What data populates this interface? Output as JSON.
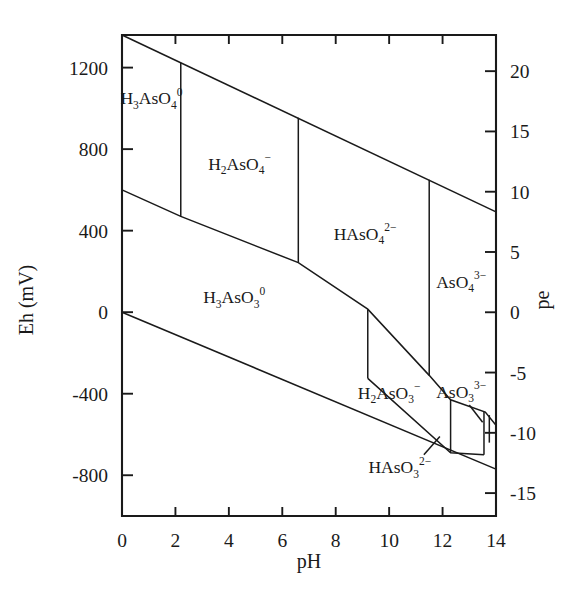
{
  "figure": {
    "kind": "eh-ph-pourbaix-diagram",
    "background_color": "#ffffff",
    "line_color": "#1a1a1a"
  },
  "axes": {
    "x": {
      "title": "pH",
      "min": 0,
      "max": 14,
      "tick_values": [
        0,
        2,
        4,
        6,
        8,
        10,
        12,
        14
      ],
      "tick_labels": [
        "0",
        "2",
        "4",
        "6",
        "8",
        "10",
        "12",
        "14"
      ]
    },
    "y_left": {
      "title": "Eh (mV)",
      "min": -1000,
      "max": 1360,
      "tick_values": [
        1200,
        800,
        400,
        0,
        -400,
        -800
      ],
      "tick_labels": [
        "1200",
        "800",
        "400",
        "0",
        "-400",
        "-800"
      ]
    },
    "y_right": {
      "title": "pe",
      "min": -16.9,
      "max": 23.0,
      "tick_values": [
        20,
        15,
        10,
        5,
        0,
        -5,
        -10,
        -15
      ],
      "tick_labels": [
        "20",
        "15",
        "10",
        "5",
        "0",
        "-5",
        "-10",
        "-15"
      ]
    }
  },
  "chart_data": {
    "type": "line",
    "title": "",
    "xlabel": "pH",
    "ylabel": "Eh (mV)",
    "ylabel_secondary": "pe",
    "xlim": [
      0,
      14
    ],
    "ylim": [
      -1000,
      1360
    ],
    "ylim_secondary": [
      -16.9,
      23.0
    ],
    "grid": false,
    "legend": "none",
    "fields": [
      {
        "name": "H3AsO4-0",
        "label_parts": [
          {
            "t": "H",
            "k": "base"
          },
          {
            "t": "3",
            "k": "sub"
          },
          {
            "t": "AsO",
            "k": "base"
          },
          {
            "t": "4",
            "k": "sub"
          },
          {
            "t": "0",
            "k": "sup"
          }
        ],
        "label_ph": 1.1,
        "label_eh": 1020
      },
      {
        "name": "H2AsO4-minus",
        "label_parts": [
          {
            "t": "H",
            "k": "base"
          },
          {
            "t": "2",
            "k": "sub"
          },
          {
            "t": "AsO",
            "k": "base"
          },
          {
            "t": "4",
            "k": "sub"
          },
          {
            "t": "−",
            "k": "sup"
          }
        ],
        "label_ph": 4.4,
        "label_eh": 700
      },
      {
        "name": "HAsO4-2minus",
        "label_parts": [
          {
            "t": "HAsO",
            "k": "base"
          },
          {
            "t": "4",
            "k": "sub"
          },
          {
            "t": "2−",
            "k": "sup"
          }
        ],
        "label_ph": 9.1,
        "label_eh": 355
      },
      {
        "name": "AsO4-3minus",
        "label_parts": [
          {
            "t": "AsO",
            "k": "base"
          },
          {
            "t": "4",
            "k": "sub"
          },
          {
            "t": "3−",
            "k": "sup"
          }
        ],
        "label_ph": 12.7,
        "label_eh": 120
      },
      {
        "name": "H3AsO3-0",
        "label_parts": [
          {
            "t": "H",
            "k": "base"
          },
          {
            "t": "3",
            "k": "sub"
          },
          {
            "t": "AsO",
            "k": "base"
          },
          {
            "t": "3",
            "k": "sub"
          },
          {
            "t": "0",
            "k": "sup"
          }
        ],
        "label_ph": 4.2,
        "label_eh": 45
      },
      {
        "name": "H2AsO3-minus",
        "label_parts": [
          {
            "t": "H",
            "k": "base"
          },
          {
            "t": "2",
            "k": "sub"
          },
          {
            "t": "AsO",
            "k": "base"
          },
          {
            "t": "3",
            "k": "sub"
          },
          {
            "t": "−",
            "k": "sup"
          }
        ],
        "label_ph": 10.0,
        "label_eh": -425
      },
      {
        "name": "AsO3-3minus",
        "label_parts": [
          {
            "t": "AsO",
            "k": "base"
          },
          {
            "t": "3",
            "k": "sub"
          },
          {
            "t": "3−",
            "k": "sup"
          }
        ],
        "label_ph": 12.7,
        "label_eh": -420
      },
      {
        "name": "HAsO3-2minus",
        "label_parts": [
          {
            "t": "HAsO",
            "k": "base"
          },
          {
            "t": "3",
            "k": "sub"
          },
          {
            "t": "2−",
            "k": "sup"
          }
        ],
        "label_ph": 10.4,
        "label_eh": -790
      }
    ],
    "series": [
      {
        "name": "water-upper-stability-limit",
        "comment": "O2/H2O line across full pH range",
        "points": [
          [
            0,
            1360
          ],
          [
            14,
            492
          ]
        ]
      },
      {
        "name": "water-lower-stability-limit",
        "comment": "H2O/H2 line across full pH range",
        "points": [
          [
            0,
            0
          ],
          [
            14,
            -770
          ]
        ]
      },
      {
        "name": "As(V)/As(III)-redox-boundary",
        "comment": "stepped boundary between arsenate and arsenite fields",
        "points": [
          [
            0,
            600
          ],
          [
            2.2,
            470
          ],
          [
            6.6,
            243
          ],
          [
            9.2,
            15
          ],
          [
            11.5,
            -310
          ],
          [
            12.3,
            -430
          ],
          [
            13.6,
            -490
          ],
          [
            14,
            -555
          ]
        ]
      },
      {
        "name": "H3AsO4/H2AsO4-vertical",
        "ph": 2.2,
        "points": [
          [
            2.2,
            1224
          ],
          [
            2.2,
            470
          ]
        ]
      },
      {
        "name": "H2AsO4/HAsO4-vertical",
        "ph": 6.6,
        "points": [
          [
            6.6,
            954
          ],
          [
            6.6,
            243
          ]
        ]
      },
      {
        "name": "HAsO4/AsO4-vertical",
        "ph": 11.5,
        "points": [
          [
            11.5,
            650
          ],
          [
            11.5,
            -310
          ]
        ]
      },
      {
        "name": "H3AsO3/H2AsO3-vertical",
        "ph": 9.2,
        "points": [
          [
            9.2,
            15
          ],
          [
            9.2,
            -325
          ]
        ]
      },
      {
        "name": "H2AsO3/AsO3-vertical",
        "ph": 12.3,
        "points": [
          [
            12.3,
            -430
          ],
          [
            12.3,
            -690
          ]
        ]
      },
      {
        "name": "AsO3-sliver-left-vertical",
        "ph": 13.55,
        "points": [
          [
            13.55,
            -490
          ],
          [
            13.55,
            -700
          ]
        ]
      },
      {
        "name": "AsO3-sliver-right-vertical",
        "ph": 13.75,
        "points": [
          [
            13.75,
            -505
          ],
          [
            13.75,
            -640
          ]
        ]
      },
      {
        "name": "H2AsO3/HAsO3-boundary",
        "comment": "lower sloping boundary in arsenite region",
        "points": [
          [
            9.2,
            -325
          ],
          [
            12.3,
            -690
          ],
          [
            13.55,
            -700
          ]
        ]
      }
    ],
    "annotations": [
      {
        "name": "AsO3-leader-line",
        "from_ph": 13.0,
        "from_eh": -455,
        "to_ph": 13.5,
        "to_eh": -540
      },
      {
        "name": "HAsO3-leader-line",
        "from_ph": 11.3,
        "from_eh": -700,
        "to_ph": 11.9,
        "to_eh": -610
      }
    ]
  }
}
